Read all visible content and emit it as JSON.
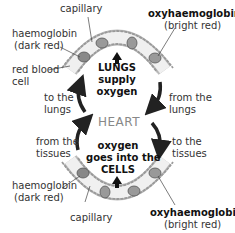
{
  "diagram": {
    "top": {
      "capillary": "capillary",
      "haemoglobin": "haemoglobin",
      "haemoglobin_note": "(dark red)",
      "red_blood": "red blood",
      "cell": "cell",
      "oxy": "oxyhaemoglobin",
      "oxy_note": "(bright red)",
      "center_1": "LUNGS",
      "center_2": "supply",
      "center_3": "oxygen"
    },
    "middle": {
      "heart": "HEART",
      "to_lungs_1": "to the",
      "to_lungs_2": "lungs",
      "from_lungs_1": "from the",
      "from_lungs_2": "lungs",
      "from_tissues_1": "from the",
      "from_tissues_2": "tissues",
      "to_tissues_1": "to the",
      "to_tissues_2": "tissues"
    },
    "bottom": {
      "center_1": "oxygen",
      "center_2": "goes into the",
      "center_3": "CELLS",
      "haemoglobin": "haemoglobin",
      "haemoglobin_note": "(dark red)",
      "capillary": "capillary",
      "oxy": "oxyhaemoglobin",
      "oxy_note": "(bright red)"
    }
  }
}
